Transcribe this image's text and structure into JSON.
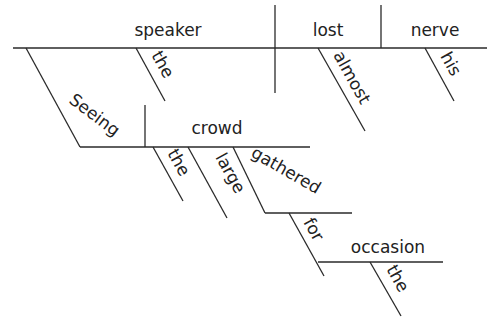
{
  "diagram": {
    "type": "sentence-diagram",
    "sentence": "Seeing the large crowd gathered for the occasion, the speaker almost lost his nerve.",
    "subject": "speaker",
    "verb": "lost",
    "object": "nerve",
    "modifiers": {
      "subject_article": "the",
      "verb_adverb": "almost",
      "object_possessive": "his"
    },
    "participial_phrase": {
      "participle": "Seeing",
      "object": "crowd",
      "object_article": "the",
      "object_adjective": "large",
      "modifying_participle": "gathered",
      "preposition": "for",
      "prep_object": "occasion",
      "prep_object_article": "the"
    }
  }
}
